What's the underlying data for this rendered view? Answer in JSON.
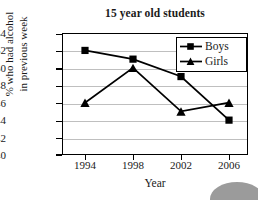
{
  "chart_data": {
    "type": "line",
    "title": "15 year old students",
    "xlabel": "Year",
    "ylabel_line1": "% who had alcohol",
    "ylabel_line2": "in previous week",
    "categories": [
      "1994",
      "1998",
      "2002",
      "2006"
    ],
    "x": [
      1994,
      1998,
      2002,
      2006
    ],
    "series": [
      {
        "name": "Boys",
        "marker": "square",
        "values": [
          52,
          51,
          49,
          44
        ]
      },
      {
        "name": "Girls",
        "marker": "triangle",
        "values": [
          46,
          50,
          45,
          46
        ]
      }
    ],
    "ylim": [
      40,
      54
    ],
    "yticks": [
      40,
      42,
      44,
      46,
      48,
      50,
      52,
      54
    ],
    "ytick_labels": [
      "40",
      "42",
      "44",
      "46",
      "48",
      "50",
      "52",
      "54"
    ],
    "grid": "horizontal",
    "legend_position": "top-right-inside",
    "colors": {
      "series": "#000000",
      "gridline": "#bfbfbf",
      "axis": "#000000",
      "background": "#ffffff",
      "decoration": "#9b9b9b"
    }
  },
  "legend": {
    "entries": [
      {
        "label": "Boys",
        "marker": "square-marker-icon"
      },
      {
        "label": "Girls",
        "marker": "triangle-marker-icon"
      }
    ]
  },
  "decoration": {
    "corner_shape": "gray-ellipse-decoration"
  }
}
